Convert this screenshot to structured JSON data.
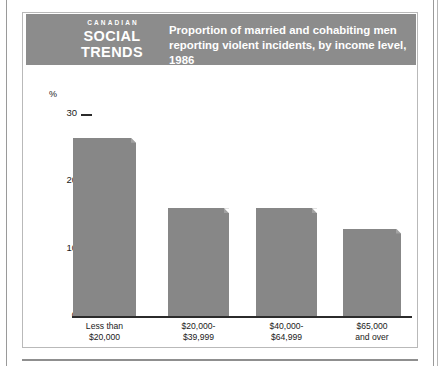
{
  "publication": {
    "line1": "CANADIAN",
    "line2": "SOCIAL",
    "line3": "TRENDS"
  },
  "header": {
    "title": "Proportion of married and cohabiting men reporting violent incidents, by income level, 1986"
  },
  "colors": {
    "banner": "#8c8c8c",
    "bar": "#878787",
    "frame": "#b9b9b9",
    "text": "#1a1a1a",
    "banner_text": "#ffffff"
  },
  "chart_data": {
    "type": "bar",
    "title": "Proportion of married and cohabiting men reporting violent incidents, by income level, 1986",
    "categories": [
      "Less than $20,000",
      "$20,000-$39,999",
      "$40,000-$64,999",
      "$65,000 and over"
    ],
    "category_lines": [
      [
        "Less than",
        "$20,000"
      ],
      [
        "$20,000-",
        "$39,999"
      ],
      [
        "$40,000-",
        "$64,999"
      ],
      [
        "$65,000",
        "and over"
      ]
    ],
    "values": [
      26.5,
      16,
      16,
      13
    ],
    "xlabel": "",
    "ylabel": "%",
    "ylim": [
      0,
      30
    ],
    "yticks": [
      0,
      10,
      20,
      30
    ],
    "ytick_labels": [
      "0",
      "10",
      "20",
      "30"
    ],
    "grid": false,
    "legend": false
  }
}
